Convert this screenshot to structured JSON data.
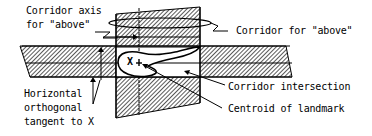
{
  "diagram": {
    "labels": {
      "corridor_axis_line1": "Corridor axis",
      "corridor_axis_line2": "for \"above\"",
      "corridor_for_above": "Corridor for \"above\"",
      "corridor_intersection": "Corridor intersection",
      "centroid_of_landmark": "Centroid of landmark",
      "horizontal_line1": "Horizontal",
      "horizontal_line2": "orthogonal",
      "horizontal_line3": "tangent to X",
      "landmark_marker": "X"
    },
    "colors": {
      "ink": "#000000",
      "background": "#ffffff"
    }
  }
}
